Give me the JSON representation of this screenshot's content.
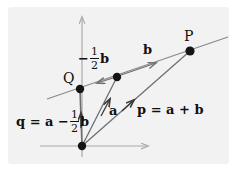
{
  "figure": {
    "kind": "vector-addition-diagram",
    "background_color": "#ffffff",
    "panel_color": "#f2f2f2",
    "ink_color": "#101010",
    "line_color": "#8a8a8a",
    "axis_color": "#a8a8a8"
  },
  "points": {
    "origin": {
      "label": "",
      "x": 82,
      "y": 146
    },
    "q": {
      "label": "Q",
      "x": 80,
      "y": 89
    },
    "p": {
      "label": "P",
      "x": 190,
      "y": 51
    },
    "a_tip": {
      "label": "",
      "x": 117,
      "y": 77
    }
  },
  "labels": {
    "point_q": "Q",
    "point_p": "P",
    "vector_b": "b",
    "vector_a": "a",
    "half_b_minus": "−",
    "half_b_numerator": "1",
    "half_b_denominator": "2",
    "half_b_vector": "b",
    "p_equation_lhs": "p",
    "p_equation_eq": "=",
    "p_equation_a": "a",
    "p_equation_plus": "+",
    "p_equation_b": "b",
    "q_equation_lhs": "q",
    "q_equation_eq": "=",
    "q_equation_a": "a",
    "q_equation_minus": "−",
    "q_equation_numerator": "1",
    "q_equation_denominator": "2",
    "q_equation_b": "b"
  },
  "axes": {
    "x_axis": {
      "x1": 40,
      "y1": 146,
      "x2": 150,
      "y2": 146,
      "arrow": "right"
    },
    "y_axis": {
      "x1": 82,
      "y1": 156,
      "x2": 82,
      "y2": 15,
      "arrow": "up"
    }
  }
}
